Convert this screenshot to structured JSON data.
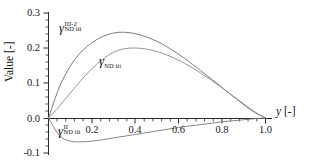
{
  "chart_data": {
    "type": "line",
    "title": "",
    "xlabel": "y [-]",
    "ylabel": "Value [-]",
    "xlim": [
      0.0,
      1.0
    ],
    "ylim": [
      -0.1,
      0.3
    ],
    "grid": false,
    "legend_position": "inline-annotations",
    "xticks": [
      "0.2",
      "0.4",
      "0.6",
      "0.8",
      "1.0"
    ],
    "xtick_values": [
      0.2,
      0.4,
      0.6,
      0.8,
      1.0
    ],
    "yticks": [
      "0.3",
      "0.2",
      "0.1",
      "0.0",
      "-0.1"
    ],
    "ytick_values": [
      0.3,
      0.2,
      0.1,
      0.0,
      -0.1
    ],
    "x": [
      0.0,
      0.05,
      0.1,
      0.15,
      0.2,
      0.25,
      0.3,
      0.35,
      0.4,
      0.45,
      0.5,
      0.55,
      0.6,
      0.65,
      0.7,
      0.75,
      0.8,
      0.85,
      0.9,
      0.95,
      1.0
    ],
    "series": [
      {
        "name": "gamma_ND_iii_III-2",
        "label_base": "γ",
        "label_sup": "III-2",
        "label_sub": "ND iii",
        "color": "#6f6f6f",
        "values": [
          0.0,
          0.088,
          0.148,
          0.188,
          0.215,
          0.233,
          0.243,
          0.245,
          0.241,
          0.232,
          0.219,
          0.202,
          0.182,
          0.16,
          0.136,
          0.112,
          0.087,
          0.062,
          0.038,
          0.016,
          0.0
        ]
      },
      {
        "name": "gamma_ND_iii",
        "label_base": "γ",
        "label_sup": "",
        "label_sub": "ND iii",
        "color": "#8a8a8a",
        "values": [
          0.0,
          0.034,
          0.071,
          0.108,
          0.141,
          0.168,
          0.188,
          0.198,
          0.2,
          0.197,
          0.19,
          0.179,
          0.165,
          0.148,
          0.129,
          0.108,
          0.086,
          0.063,
          0.04,
          0.018,
          0.0
        ]
      },
      {
        "name": "gamma_ND_iii_II",
        "label_base": "γ",
        "label_sup": "II",
        "label_sub": "ND iii",
        "color": "#7a7a7a",
        "values": [
          0.0,
          -0.05,
          -0.066,
          -0.068,
          -0.066,
          -0.062,
          -0.057,
          -0.052,
          -0.047,
          -0.042,
          -0.037,
          -0.032,
          -0.027,
          -0.023,
          -0.019,
          -0.015,
          -0.011,
          -0.008,
          -0.005,
          -0.002,
          0.0
        ]
      }
    ],
    "annotations": [
      {
        "name": "label-gamma-III-2",
        "text": "γ III-2 ND iii",
        "x_px": 59,
        "y_px": 21
      },
      {
        "name": "label-gamma-ND",
        "text": "γ ND iii",
        "x_px": 99,
        "y_px": 54
      },
      {
        "name": "label-gamma-II",
        "text": "γ II ND iii",
        "x_px": 58,
        "y_px": 124
      }
    ]
  },
  "axis": {
    "y_title": "Value [-]",
    "x_title_var": "y",
    "x_title_unit": " [-]"
  },
  "colors": {
    "axis": "#2b2b2b",
    "text": "#141414",
    "curve_primary": "#6f6f6f",
    "curve_secondary": "#8a8a8a",
    "curve_negative": "#7a7a7a",
    "background": "#ffffff"
  }
}
